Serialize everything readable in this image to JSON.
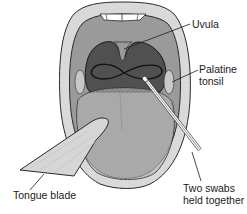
{
  "figure": {
    "labels": {
      "uvula": "Uvula",
      "palatine_tonsil_line1": "Palatine",
      "palatine_tonsil_line2": "tonsil",
      "tongue_blade": "Tongue blade",
      "swabs_line1": "Two swabs",
      "swabs_line2": "held together"
    },
    "colors": {
      "lips": "#d9d9d9",
      "mouth_outline": "#2a2a2a",
      "palate": "#9a9a9a",
      "pharynx": "#505050",
      "tongue": "#b5b5b5",
      "tongue_blade": "#d6d6d6",
      "teeth": "#ffffff",
      "swab": "#ffffff",
      "leader_line": "#1a1a1a"
    }
  }
}
